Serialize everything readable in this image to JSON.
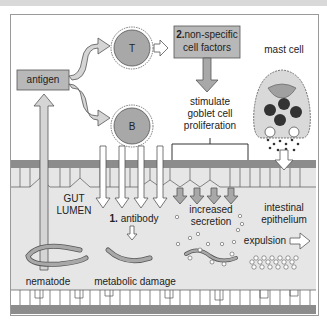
{
  "diagram": {
    "nodes": {
      "antigen": "antigen",
      "t_cell": "T",
      "b_cell": "B",
      "factors_num": "2.",
      "factors_line1": "non-specific",
      "factors_line2": "cell factors",
      "mast_cell": "mast cell",
      "stimulate_line1": "stimulate",
      "stimulate_line2": "goblet cell",
      "stimulate_line3": "proliferation",
      "gut_lumen_line1": "GUT",
      "gut_lumen_line2": "LUMEN",
      "antibody_num": "1.",
      "antibody": "antibody",
      "increased_line1": "increased",
      "increased_line2": "secretion",
      "intestinal_line1": "intestinal",
      "intestinal_line2": "epithelium",
      "expulsion": "expulsion",
      "nematode": "nematode",
      "metabolic_damage": "metabolic damage"
    },
    "colors": {
      "box_fill": "#b8b8b8",
      "cell_fill": "#a8a8a8",
      "lumen_fill": "#e6e6e6",
      "membrane": "#8c8c8c",
      "granule": "#333333"
    }
  }
}
